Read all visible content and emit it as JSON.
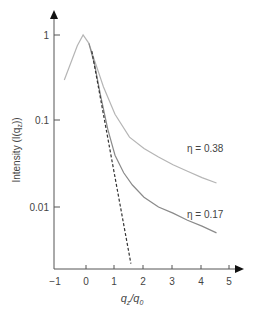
{
  "chart_data": {
    "type": "line",
    "title": "",
    "xlabel": "q_z/q_0",
    "ylabel": "Intensity (I(q_z))",
    "yscale": "log",
    "xlim": [
      -1,
      5
    ],
    "ylim": [
      0.002,
      1
    ],
    "x_ticks": [
      -1,
      0,
      1,
      2,
      3,
      4,
      5
    ],
    "x_tick_labels": [
      "−1",
      "0",
      "1",
      "2",
      "3",
      "4",
      "5"
    ],
    "y_ticks": [
      1,
      0.1,
      0.01
    ],
    "y_tick_labels": [
      "1",
      "0.1",
      "0.01"
    ],
    "grid": false,
    "legend": "inline annotations",
    "series": [
      {
        "name": "η = 0.38",
        "style": "solid",
        "color": "#b5b5b5",
        "x": [
          -0.75,
          -0.3,
          -0.1,
          0.1,
          0.3,
          0.6,
          1.0,
          1.5,
          2.0,
          2.5,
          3.0,
          3.5,
          4.0,
          4.5
        ],
        "y": [
          0.3,
          0.75,
          1.0,
          0.8,
          0.5,
          0.25,
          0.12,
          0.065,
          0.048,
          0.038,
          0.031,
          0.026,
          0.022,
          0.019
        ]
      },
      {
        "name": "η = 0.17",
        "style": "solid",
        "color": "#8a8a8a",
        "x": [
          0.1,
          0.3,
          0.5,
          0.75,
          1.0,
          1.3,
          1.6,
          2.0,
          2.5,
          3.0,
          3.5,
          4.0,
          4.5
        ],
        "y": [
          0.8,
          0.45,
          0.2,
          0.08,
          0.04,
          0.025,
          0.018,
          0.013,
          0.01,
          0.0085,
          0.007,
          0.006,
          0.005
        ]
      },
      {
        "name": "reference (dashed)",
        "style": "dashed",
        "color": "#333333",
        "x": [
          0.2,
          1.55
        ],
        "y": [
          0.65,
          0.0022
        ]
      }
    ],
    "annotations": [
      {
        "text": "η = 0.38",
        "x": 3.7,
        "y": 0.055
      },
      {
        "text": "η = 0.17",
        "x": 3.7,
        "y": 0.0095
      }
    ]
  },
  "labels": {
    "xlabel_main": "q",
    "xlabel_sub": "z",
    "xlabel_slash": "/q",
    "xlabel_sub2": "0",
    "ylabel_text": "Intensity (I(q",
    "ylabel_sub": "z",
    "ylabel_end": "))",
    "eta1": "η = 0.38",
    "eta2": "η = 0.17",
    "xt0": "−1",
    "xt1": "0",
    "xt2": "1",
    "xt3": "2",
    "xt4": "3",
    "xt5": "4",
    "xt6": "5",
    "yt0": "1",
    "yt1": "0.1",
    "yt2": "0.01"
  }
}
